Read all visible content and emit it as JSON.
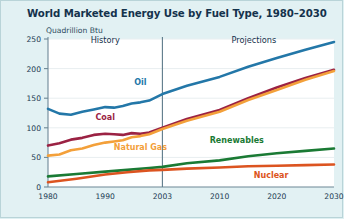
{
  "chart_data": {
    "type": "line",
    "title": "World Marketed Energy Use by Fuel Type, 1980–2030",
    "ylabel": "Quadrillion Btu",
    "xlabel": "",
    "ylim": [
      0,
      250
    ],
    "yticks": [
      0,
      50,
      100,
      150,
      200,
      250
    ],
    "xticks": [
      1980,
      1990,
      2003,
      2010,
      2020,
      2030
    ],
    "xlim": [
      1980,
      2030
    ],
    "grid": true,
    "legend": "inline-labels",
    "annotations": [
      {
        "text": "History",
        "x": 1990,
        "y": 243
      },
      {
        "text": "Projections",
        "x": 2016,
        "y": 243
      }
    ],
    "divider": {
      "x": 2003,
      "label": "history-projection-divider"
    },
    "series": [
      {
        "name": "Oil",
        "color": "#2377a8",
        "label_x": 1998,
        "label_y": 172,
        "x": [
          1980,
          1982,
          1984,
          1986,
          1988,
          1990,
          1992,
          1994,
          1996,
          1998,
          2000,
          2003,
          2006,
          2010,
          2015,
          2020,
          2025,
          2030
        ],
        "values": [
          132,
          124,
          122,
          127,
          131,
          135,
          134,
          137,
          141,
          143,
          146,
          157,
          171,
          186,
          203,
          218,
          232,
          245
        ]
      },
      {
        "name": "Coal",
        "color": "#9b2243",
        "label_x": 1990,
        "label_y": 113,
        "x": [
          1980,
          1982,
          1984,
          1986,
          1988,
          1990,
          1992,
          1994,
          1996,
          1998,
          2000,
          2003,
          2006,
          2010,
          2015,
          2020,
          2025,
          2030
        ],
        "values": [
          70,
          74,
          80,
          83,
          88,
          90,
          89,
          88,
          91,
          90,
          92,
          100,
          115,
          130,
          150,
          168,
          184,
          198
        ]
      },
      {
        "name": "Natural Gas",
        "color": "#f3a03a",
        "label_x": 1998,
        "label_y": 62,
        "x": [
          1980,
          1982,
          1984,
          1986,
          1988,
          1990,
          1992,
          1994,
          1996,
          1998,
          2000,
          2003,
          2006,
          2010,
          2015,
          2020,
          2025,
          2030
        ],
        "values": [
          53,
          55,
          62,
          65,
          71,
          75,
          77,
          79,
          84,
          86,
          89,
          98,
          112,
          127,
          147,
          164,
          181,
          196
        ]
      },
      {
        "name": "Renewables",
        "color": "#1a7a34",
        "label_x": 2013,
        "label_y": 74,
        "x": [
          1980,
          1985,
          1990,
          1995,
          2000,
          2003,
          2006,
          2010,
          2015,
          2020,
          2025,
          2030
        ],
        "values": [
          18,
          22,
          26,
          29,
          32,
          34,
          40,
          45,
          52,
          57,
          61,
          65
        ]
      },
      {
        "name": "Nuclear",
        "color": "#dc5420",
        "label_x": 2019,
        "label_y": 16,
        "x": [
          1980,
          1985,
          1990,
          1995,
          2000,
          2003,
          2006,
          2010,
          2015,
          2020,
          2025,
          2030
        ],
        "values": [
          8,
          14,
          21,
          25,
          28,
          29,
          31,
          33,
          35,
          36,
          37,
          38
        ]
      }
    ]
  }
}
